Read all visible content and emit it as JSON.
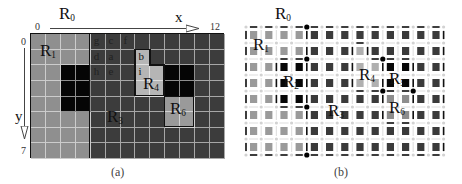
{
  "panel_a": {
    "caption": "(a)",
    "title_label": "R",
    "title_sub": "0",
    "x_axis": {
      "label": "x",
      "start": "0",
      "end": "12"
    },
    "y_axis": {
      "label": "y",
      "start": "0",
      "end": "7"
    },
    "grid": {
      "cols": 13,
      "rows": 8
    },
    "colors": {
      "R1": "#8f8f8f",
      "R2": "#050505",
      "R3": "#3c3c3c",
      "R4": "#b5b5b5",
      "R5": "#050505",
      "R6": "#9a9a9a"
    },
    "regions": [
      {
        "id": "R1",
        "label": "R",
        "sub": "1"
      },
      {
        "id": "R3",
        "label": "R",
        "sub": "3"
      },
      {
        "id": "R4",
        "label": "R",
        "sub": "4"
      },
      {
        "id": "R6",
        "label": "R",
        "sub": "6"
      }
    ],
    "cell_letters": [
      {
        "ch": "g",
        "col": 4,
        "row": 0
      },
      {
        "ch": "c",
        "col": 5,
        "row": 0
      },
      {
        "ch": "f",
        "col": 6,
        "row": 0
      },
      {
        "ch": "d",
        "col": 4,
        "row": 1
      },
      {
        "ch": "a",
        "col": 5,
        "row": 1
      },
      {
        "ch": "b",
        "col": 7,
        "row": 1
      },
      {
        "ch": "h",
        "col": 4,
        "row": 2
      },
      {
        "ch": "e",
        "col": 5,
        "row": 2
      },
      {
        "ch": "i",
        "col": 7,
        "row": 2
      }
    ]
  },
  "panel_b": {
    "caption": "(b)",
    "title_label": "R",
    "title_sub": "0",
    "grid": {
      "cols": 13,
      "rows": 8
    },
    "regions": [
      {
        "id": "R1",
        "label": "R",
        "sub": "1"
      },
      {
        "id": "R2",
        "label": "R",
        "sub": "2"
      },
      {
        "id": "R3",
        "label": "R",
        "sub": "3"
      },
      {
        "id": "R4",
        "label": "R",
        "sub": "4"
      },
      {
        "id": "R5",
        "label": "R",
        "sub": "5"
      },
      {
        "id": "R6",
        "label": "R",
        "sub": "6"
      }
    ]
  }
}
